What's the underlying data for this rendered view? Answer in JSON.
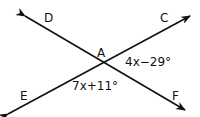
{
  "diagram": {
    "points": {
      "A": {
        "label": "A",
        "x": 102,
        "y": 63
      },
      "C": {
        "label": "C",
        "x": 190,
        "y": 16
      },
      "D": {
        "label": "D",
        "x": 25,
        "y": 16
      },
      "E": {
        "label": "E",
        "x": 8,
        "y": 114
      },
      "F": {
        "label": "F",
        "x": 185,
        "y": 110
      }
    },
    "lines": [
      {
        "name": "line-DF",
        "from": "D",
        "to": "F"
      },
      {
        "name": "line-EC",
        "from": "E",
        "to": "C"
      }
    ],
    "angles": {
      "CAF": {
        "expression": "4x−29°"
      },
      "EAF": {
        "expression": "7x+11°"
      }
    }
  }
}
